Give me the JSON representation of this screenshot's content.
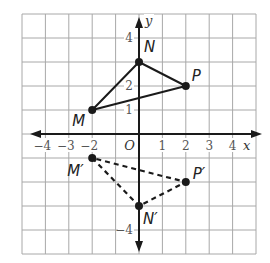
{
  "diagram": {
    "type": "coordinate-plane",
    "grid": {
      "xmin": -5,
      "xmax": 5,
      "ymin": -5,
      "ymax": 5,
      "step": 1
    },
    "axes": {
      "x_label": "x",
      "y_label": "y",
      "origin_label": "O",
      "x_ticks": [
        {
          "value": -4,
          "label": "−4"
        },
        {
          "value": -3,
          "label": "−3"
        },
        {
          "value": -2,
          "label": "−2"
        },
        {
          "value": 1,
          "label": "1"
        },
        {
          "value": 2,
          "label": "2"
        },
        {
          "value": 3,
          "label": "3"
        },
        {
          "value": 4,
          "label": "4"
        }
      ],
      "y_ticks": [
        {
          "value": 4,
          "label": "4"
        },
        {
          "value": 2,
          "label": "2"
        },
        {
          "value": 1,
          "label": "1"
        },
        {
          "value": -4,
          "label": "−4"
        }
      ]
    },
    "original_triangle": {
      "style": "solid",
      "vertices": [
        {
          "name": "M",
          "x": -2,
          "y": 1
        },
        {
          "name": "N",
          "x": 0,
          "y": 3
        },
        {
          "name": "P",
          "x": 2,
          "y": 2
        }
      ]
    },
    "image_triangle": {
      "style": "dashed",
      "vertices": [
        {
          "name": "M′",
          "x": -2,
          "y": -1
        },
        {
          "name": "N′",
          "x": 0,
          "y": -3
        },
        {
          "name": "P′",
          "x": 2,
          "y": -2
        }
      ]
    },
    "colors": {
      "grid": "#a8a8a8",
      "axis": "#1a1a1a",
      "triangle": "#1a1a1a",
      "tick_text": "#555555"
    }
  }
}
